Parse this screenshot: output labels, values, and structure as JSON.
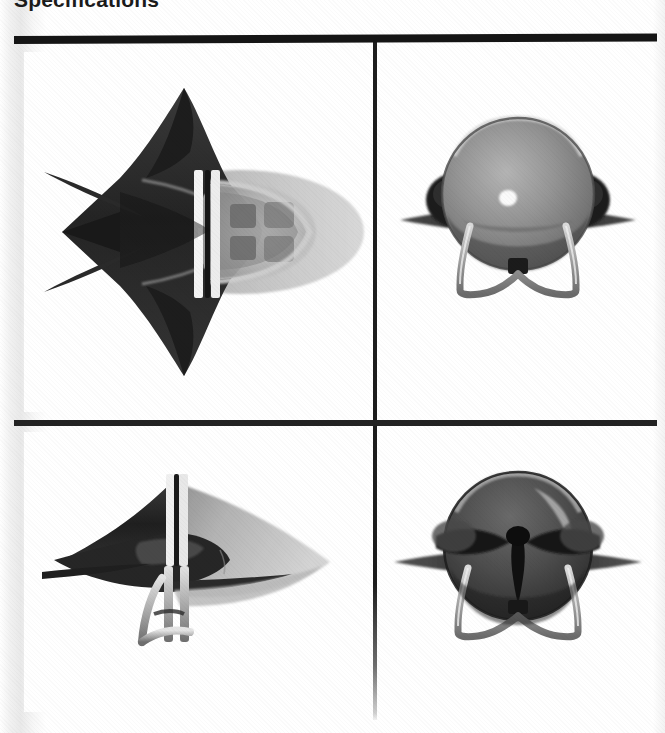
{
  "page": {
    "heading": "Specifications",
    "background_color": "#ffffff",
    "ink_color": "#151515",
    "width": 665,
    "height": 733
  },
  "rules": {
    "top_rule_name": "top-horizontal-rule",
    "mid_rule_name": "middle-horizontal-rule",
    "vertical_rule_name": "vertical-divider-rule"
  },
  "figures": {
    "caption_note": "",
    "panels": [
      {
        "id": "top-left",
        "view": "plan-view",
        "alt": "Top plan view of a swept-wing aircraft model with bubble canopy and twin fins"
      },
      {
        "id": "top-right",
        "view": "front-view",
        "alt": "Front view of the aircraft model showing spherical canopy, side engine nacelles, thin wings and wire landing gear"
      },
      {
        "id": "bottom-left",
        "view": "side-profile-view",
        "alt": "Side profile view of the aircraft model showing delta wing and landing gear struts"
      },
      {
        "id": "bottom-right",
        "view": "rear-view",
        "alt": "Rear view of the aircraft model showing dark exhaust section, wings and landing gear"
      }
    ]
  },
  "palette": {
    "dark_body": "#2c2c2c",
    "mid_body": "#5a5a5a",
    "light_body": "#b8b8b8",
    "highlight": "#f2f2f2",
    "canopy": "#8e8e8e",
    "shadow": "#1a1a1a"
  }
}
